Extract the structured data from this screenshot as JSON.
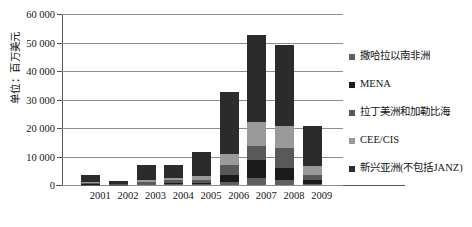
{
  "chart_data": {
    "type": "bar",
    "stacked": true,
    "title": "",
    "subtitle": "",
    "xlabel": "",
    "ylabel": "单位：百万美元",
    "categories": [
      "2001",
      "2002",
      "2003",
      "2004",
      "2005",
      "2006",
      "2007",
      "2008",
      "2009"
    ],
    "ylim": [
      0,
      60000
    ],
    "ytick_labels": [
      "0",
      "10 000",
      "20 000",
      "30 000",
      "40 000",
      "50 000",
      "60 000"
    ],
    "ytick_values": [
      0,
      10000,
      20000,
      30000,
      40000,
      50000,
      60000
    ],
    "grid": true,
    "legend_position": "right",
    "series": [
      {
        "name": "新兴亚洲(不包括JANZ)",
        "color": "#2b2b2b",
        "values": [
          2400,
          1200,
          5200,
          4600,
          8300,
          21700,
          30800,
          28600,
          14200
        ]
      },
      {
        "name": "CEE/CIS",
        "color": "#9a9a9a",
        "values": [
          300,
          150,
          700,
          900,
          1400,
          4000,
          8200,
          7600,
          3000
        ]
      },
      {
        "name": "拉丁美洲和加勒比海",
        "color": "#595959",
        "values": [
          400,
          100,
          700,
          900,
          1100,
          3300,
          5100,
          7000,
          1800
        ]
      },
      {
        "name": "MENA",
        "color": "#1b1b1b",
        "values": [
          200,
          50,
          300,
          500,
          500,
          2600,
          6100,
          4300,
          1400
        ]
      },
      {
        "name": "撒哈拉以南非洲",
        "color": "#5f5f5f",
        "values": [
          100,
          50,
          200,
          300,
          300,
          1000,
          2600,
          1700,
          400
        ]
      }
    ],
    "totals": [
      3400,
      1550,
      7100,
      7200,
      11600,
      32600,
      52800,
      49200,
      20800
    ]
  },
  "legend": {
    "items": [
      {
        "label": "撒哈拉以南非洲",
        "color": "#5f5f5f"
      },
      {
        "label": "MENA",
        "color": "#1b1b1b"
      },
      {
        "label": "拉丁美洲和加勒比海",
        "color": "#595959"
      },
      {
        "label": "CEE/CIS",
        "color": "#9a9a9a"
      },
      {
        "label": "新兴亚洲(不包括JANZ)",
        "color": "#2b2b2b"
      }
    ]
  }
}
